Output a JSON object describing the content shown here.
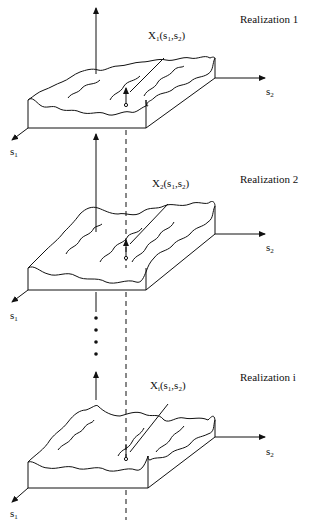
{
  "figure": {
    "realizations": [
      {
        "title": "Realization 1",
        "value_label": {
          "var": "X",
          "sub": "1",
          "args": "(s",
          "a1": "1",
          "comma": ",s",
          "a2": "2",
          "close": ")"
        },
        "axis_s1": {
          "var": "s",
          "sub": "1"
        },
        "axis_s2": {
          "var": "s",
          "sub": "2"
        }
      },
      {
        "title": "Realization 2",
        "value_label": {
          "var": "X",
          "sub": "2",
          "args": "(s",
          "a1": "1",
          "comma": ",s",
          "a2": "2",
          "close": ")"
        },
        "axis_s1": {
          "var": "s",
          "sub": "1"
        },
        "axis_s2": {
          "var": "s",
          "sub": "2"
        }
      },
      {
        "title": "Realization i",
        "value_label": {
          "var": "X",
          "sub": "i",
          "args": "(s",
          "a1": "1",
          "comma": ",s",
          "a2": "2",
          "close": ")"
        },
        "axis_s1": {
          "var": "s",
          "sub": "1"
        },
        "axis_s2": {
          "var": "s",
          "sub": "2"
        }
      }
    ],
    "ellipsis": "•••",
    "colors": {
      "stroke": "#111111",
      "background": "#ffffff"
    }
  }
}
